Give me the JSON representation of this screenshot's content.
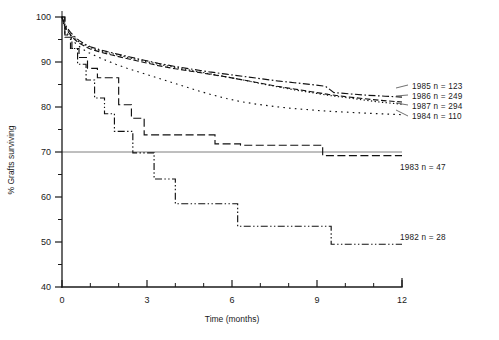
{
  "figure": {
    "background_color": "#ffffff",
    "ink_color": "#111111"
  },
  "chart_data": {
    "type": "line",
    "title": "",
    "subtitle": "",
    "xlabel": "Time (months)",
    "ylabel": "% Grafts surviving",
    "xlim": [
      0,
      12
    ],
    "ylim": [
      40,
      100
    ],
    "xticks": [
      0,
      1,
      2,
      3,
      4,
      5,
      6,
      7,
      8,
      9,
      10,
      11,
      12
    ],
    "xtick_labels": [
      "0",
      "",
      "",
      "3",
      "",
      "",
      "6",
      "",
      "",
      "9",
      "",
      "",
      "12"
    ],
    "xtick_major": [
      0,
      3,
      6,
      9,
      12
    ],
    "yticks": [
      40,
      45,
      50,
      55,
      60,
      65,
      70,
      75,
      80,
      85,
      90,
      95,
      100
    ],
    "ytick_labels": [
      "40",
      "",
      "50",
      "",
      "60",
      "",
      "70",
      "",
      "80",
      "",
      "90",
      "",
      "100"
    ],
    "ytick_major": [
      40,
      50,
      60,
      70,
      80,
      90,
      100
    ],
    "grid": false,
    "legend_position": "right",
    "annotations": [
      {
        "name": "reference-line-70",
        "type": "horizontal-line",
        "y": 70,
        "x_from": 0,
        "x_to": 12
      }
    ],
    "series": [
      {
        "name": "1985",
        "label": "1985  n = 123",
        "year": "1985",
        "n": 123,
        "dash": "dash-dot",
        "dasharray": "7,2.5,1.6,2.5",
        "label_x": 412,
        "label_y": 89,
        "x": [
          0,
          0.08,
          0.18,
          0.3,
          0.45,
          0.6,
          0.8,
          1.0,
          1.3,
          1.6,
          2.0,
          2.4,
          2.9,
          3.4,
          4.0,
          4.6,
          5.2,
          5.8,
          6.4,
          7.0,
          7.6,
          8.2,
          8.8,
          9.3,
          9.6,
          10.2,
          10.8,
          11.4,
          12.0
        ],
        "y": [
          100,
          98.6,
          97.6,
          96.6,
          95.6,
          94.8,
          94.0,
          93.4,
          92.8,
          92.3,
          91.7,
          91.1,
          90.4,
          89.7,
          89.0,
          88.4,
          87.8,
          87.3,
          86.8,
          86.3,
          85.8,
          85.4,
          85.0,
          84.6,
          83.2,
          82.9,
          82.6,
          82.4,
          82.2
        ]
      },
      {
        "name": "1986",
        "label": "1986  n = 249",
        "year": "1986",
        "n": 249,
        "dash": "dash",
        "dasharray": "5.5,2.6",
        "label_x": 412,
        "label_y": 99,
        "x": [
          0,
          0.08,
          0.18,
          0.3,
          0.45,
          0.6,
          0.8,
          1.0,
          1.3,
          1.6,
          2.0,
          2.4,
          2.9,
          3.4,
          4.0,
          4.6,
          5.2,
          5.8,
          6.4,
          7.0,
          7.6,
          8.2,
          8.8,
          9.4,
          10.0,
          10.6,
          11.2,
          12.0
        ],
        "y": [
          100,
          98.2,
          97.0,
          96.0,
          95.0,
          94.2,
          93.5,
          92.9,
          92.3,
          91.8,
          91.2,
          90.6,
          89.9,
          89.2,
          88.5,
          87.9,
          87.3,
          86.7,
          86.0,
          85.3,
          84.6,
          84.0,
          83.4,
          82.8,
          82.3,
          81.9,
          81.5,
          81.1
        ]
      },
      {
        "name": "1987",
        "label": "1987  n = 294",
        "year": "1987",
        "n": 294,
        "dash": "dot",
        "dasharray": "1.3,2.4",
        "label_x": 412,
        "label_y": 109,
        "x": [
          0,
          0.08,
          0.18,
          0.3,
          0.45,
          0.6,
          0.8,
          1.0,
          1.3,
          1.6,
          2.0,
          2.4,
          2.9,
          3.4,
          4.0,
          4.6,
          5.2,
          5.8,
          6.4,
          7.0,
          7.6,
          8.2,
          8.8,
          9.4,
          10.0,
          10.6,
          11.2,
          12.0
        ],
        "y": [
          100,
          98.4,
          97.2,
          96.2,
          95.3,
          94.5,
          93.8,
          93.2,
          92.6,
          92.1,
          91.5,
          90.9,
          90.2,
          89.5,
          88.8,
          88.1,
          87.4,
          86.7,
          86.0,
          85.2,
          84.5,
          83.8,
          83.2,
          82.6,
          82.1,
          81.6,
          81.1,
          80.6
        ]
      },
      {
        "name": "1984",
        "label": "1984  n = 110",
        "year": "1984",
        "n": 110,
        "dash": "sparse-dot",
        "dasharray": "1.6,4.2",
        "label_x": 412,
        "label_y": 119,
        "x": [
          0,
          0.08,
          0.2,
          0.35,
          0.5,
          0.7,
          0.9,
          1.2,
          1.5,
          1.9,
          2.3,
          2.8,
          3.3,
          3.8,
          4.3,
          4.8,
          5.3,
          5.8,
          6.3,
          6.9,
          7.5,
          8.1,
          8.7,
          9.3,
          9.9,
          10.5,
          11.2,
          12.0
        ],
        "y": [
          100,
          97.8,
          96.2,
          95.0,
          94.0,
          93.0,
          92.2,
          91.3,
          90.5,
          89.5,
          88.6,
          87.6,
          86.6,
          85.6,
          84.6,
          83.6,
          82.7,
          81.9,
          81.2,
          80.6,
          80.1,
          79.7,
          79.4,
          79.1,
          78.9,
          78.7,
          78.5,
          78.3
        ]
      },
      {
        "name": "1983",
        "label": "1983  n =  47",
        "year": "1983",
        "n": 47,
        "dash": "long-dash",
        "dasharray": "8,3.5",
        "label_x": 400,
        "label_y": 170,
        "step": true,
        "x": [
          0,
          0.1,
          0.1,
          0.35,
          0.35,
          0.6,
          0.6,
          0.9,
          0.9,
          1.25,
          1.25,
          1.6,
          1.6,
          2.0,
          2.0,
          2.45,
          2.45,
          2.9,
          2.9,
          5.4,
          5.4,
          6.3,
          6.3,
          9.2,
          9.2,
          12.0
        ],
        "y": [
          100,
          100,
          95.5,
          95.5,
          93.0,
          93.0,
          91.0,
          91.0,
          88.6,
          88.6,
          86.5,
          86.5,
          86.5,
          86.5,
          80.5,
          80.5,
          77.5,
          77.5,
          73.8,
          73.8,
          71.8,
          71.8,
          71.5,
          71.5,
          69.2,
          69.2
        ]
      },
      {
        "name": "1982",
        "label": "1982  n =  28",
        "year": "1982",
        "n": 28,
        "dash": "dash-dot-dot",
        "dasharray": "7,2.4,1.4,2.4,1.4,2.4",
        "label_x": 400,
        "label_y": 240,
        "step": true,
        "x": [
          0,
          0.1,
          0.1,
          0.3,
          0.3,
          0.55,
          0.55,
          0.85,
          0.85,
          1.15,
          1.15,
          1.5,
          1.5,
          1.85,
          1.85,
          2.15,
          2.15,
          2.5,
          2.5,
          3.25,
          3.25,
          4.0,
          4.0,
          6.2,
          6.2,
          9.5,
          9.5,
          12.0
        ],
        "y": [
          100,
          100,
          96.0,
          96.0,
          93.0,
          93.0,
          89.5,
          89.5,
          86.0,
          86.0,
          82.0,
          82.0,
          78.5,
          78.5,
          74.6,
          74.6,
          74.6,
          74.6,
          69.8,
          69.8,
          64.0,
          64.0,
          58.5,
          58.5,
          53.5,
          53.5,
          49.5,
          49.5
        ]
      }
    ]
  },
  "legend": {
    "entries": [
      {
        "label": "1985  n = 123"
      },
      {
        "label": "1986  n = 249"
      },
      {
        "label": "1987  n = 294"
      },
      {
        "label": "1984  n = 110"
      },
      {
        "label": "1983  n =  47"
      },
      {
        "label": "1982  n =  28"
      }
    ]
  }
}
